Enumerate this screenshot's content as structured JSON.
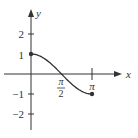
{
  "chart_data": {
    "type": "line",
    "title": "",
    "function": "y = cos(x)",
    "xlabel": "x",
    "ylabel": "y",
    "xlim": [
      0,
      3.14159
    ],
    "ylim": [
      -2,
      2
    ],
    "x_ticks": [
      {
        "value": 1.5708,
        "label_num": "π",
        "label_den": "2"
      },
      {
        "value": 3.14159,
        "label": "π"
      }
    ],
    "y_ticks": [
      {
        "value": 2,
        "label": "2"
      },
      {
        "value": 1,
        "label": "1"
      },
      {
        "value": -1,
        "label": "−1"
      },
      {
        "value": -2,
        "label": "−2"
      }
    ],
    "x": [
      0,
      0.3927,
      0.7854,
      1.1781,
      1.5708,
      1.9635,
      2.3562,
      2.7489,
      3.14159
    ],
    "values": [
      1,
      0.924,
      0.707,
      0.383,
      0,
      -0.383,
      -0.707,
      -0.924,
      -1
    ],
    "endpoints": [
      {
        "x": 0,
        "y": 1,
        "filled": true
      },
      {
        "x": 3.14159,
        "y": -1,
        "filled": true
      }
    ],
    "grid": false,
    "legend": null
  },
  "colors": {
    "axis": "#333333",
    "curve": "#333333"
  }
}
